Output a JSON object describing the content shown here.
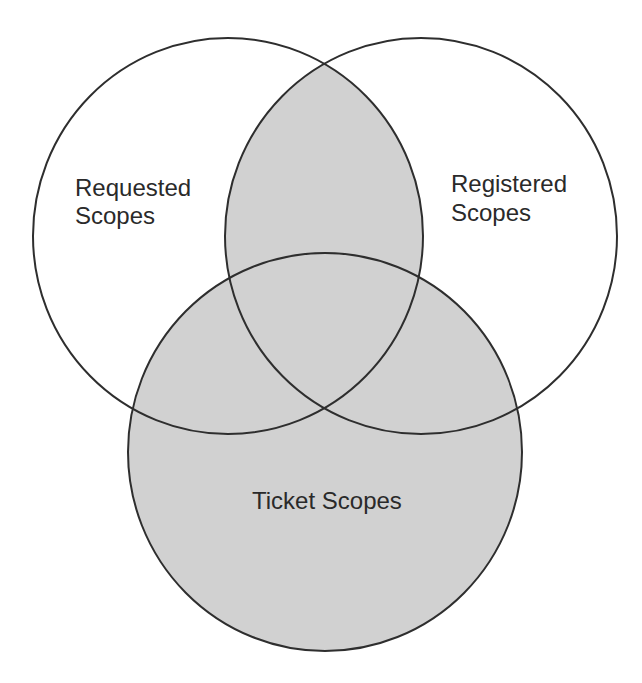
{
  "diagram": {
    "type": "venn",
    "colors": {
      "background": "#ffffff",
      "fill": "#d1d1d1",
      "stroke": "#2e2e2e",
      "text": "#2a2a2a"
    },
    "sets": [
      {
        "id": "requested",
        "label_lines": [
          "Requested",
          "Scopes"
        ],
        "shaded": false
      },
      {
        "id": "registered",
        "label_lines": [
          "Registered",
          "Scopes"
        ],
        "shaded": false
      },
      {
        "id": "ticket",
        "label_lines": [
          "Ticket Scopes"
        ],
        "shaded": true
      }
    ],
    "shaded_regions": [
      "requested ∩ registered",
      "ticket"
    ]
  }
}
